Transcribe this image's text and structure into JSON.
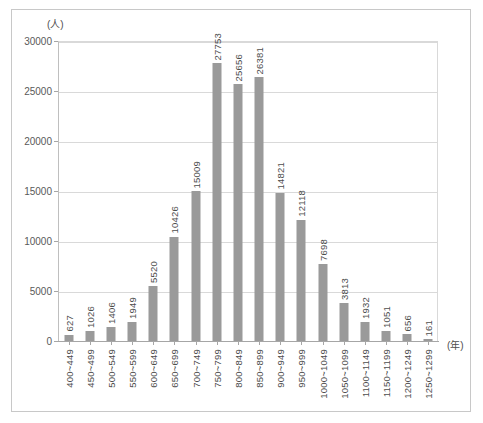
{
  "chart_data": {
    "type": "bar",
    "title": "",
    "subtitle": "",
    "xlabel": "(年)",
    "ylabel": "(人)",
    "ylim": [
      0,
      30000
    ],
    "ytick_labels": [
      "30000",
      "25000",
      "20000",
      "15000",
      "10000",
      "5000",
      "0"
    ],
    "ytick_values": [
      30000,
      25000,
      20000,
      15000,
      10000,
      5000,
      0
    ],
    "grid": true,
    "legend": "none",
    "categories": [
      "400~449",
      "450~499",
      "500~549",
      "550~599",
      "600~649",
      "650~699",
      "700~749",
      "750~799",
      "800~849",
      "850~899",
      "900~949",
      "950~999",
      "1000~1049",
      "1050~1099",
      "1100~1149",
      "1150~1199",
      "1200~1249",
      "1250~1299"
    ],
    "values": [
      627,
      1026,
      1406,
      1949,
      5520,
      10426,
      15009,
      27753,
      25656,
      26381,
      14821,
      12118,
      7698,
      3813,
      1932,
      1051,
      656,
      161
    ],
    "value_labels": [
      "627",
      "1026",
      "1406",
      "1949",
      "5520",
      "10426",
      "15009",
      "27753",
      "25656",
      "26381",
      "14821",
      "12118",
      "7698",
      "3813",
      "1932",
      "1051",
      "656",
      "161"
    ],
    "bar_color": "#9a9a9a",
    "grid_color": "#d9d9d9",
    "axis_color": "#a6a6a6",
    "text_color": "#4d4d4d",
    "border_color": "#c8c8c8"
  }
}
